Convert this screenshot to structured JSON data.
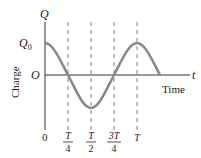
{
  "diagram": {
    "y_axis_label": "Q",
    "x_axis_label": "t",
    "quantity_label": "Charge",
    "time_label": "Time",
    "amplitude_label": "Q",
    "amplitude_subscript": "0",
    "origin_label": "O",
    "zero_tick": "0",
    "ticks": [
      {
        "num": "T",
        "den": "4"
      },
      {
        "num": "T",
        "den": "2"
      },
      {
        "num": "3T",
        "den": "4"
      },
      {
        "num": "T",
        "den": ""
      }
    ],
    "curve": "Q0 cos(2πt/T), t from 0 to 5T/4",
    "colors": {
      "curve": "#8a8a8a",
      "axis": "#333333",
      "dashed": "#777777"
    }
  }
}
